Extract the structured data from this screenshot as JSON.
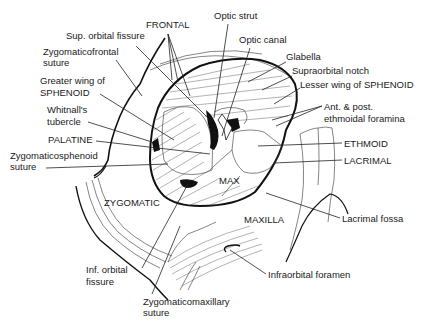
{
  "figure": {
    "labels": [
      {
        "id": "frontal",
        "text": "FRONTAL",
        "x": 146,
        "y": 28
      },
      {
        "id": "sup-orbital-fissure",
        "text": "Sup. orbital fissure",
        "x": 66,
        "y": 39
      },
      {
        "id": "zygomaticofrontal-suture-1",
        "text": "Zygomaticofrontal",
        "x": 43,
        "y": 55
      },
      {
        "id": "zygomaticofrontal-suture-2",
        "text": "suture",
        "x": 43,
        "y": 66
      },
      {
        "id": "greater-wing-1",
        "text": "Greater wing of",
        "x": 40,
        "y": 84
      },
      {
        "id": "greater-wing-2",
        "text": "SPHENOID",
        "x": 40,
        "y": 96
      },
      {
        "id": "whitnalls-1",
        "text": "Whitnall's",
        "x": 47,
        "y": 113
      },
      {
        "id": "whitnalls-2",
        "text": "tubercle",
        "x": 47,
        "y": 125
      },
      {
        "id": "palatine",
        "text": "PALATINE",
        "x": 48,
        "y": 143
      },
      {
        "id": "zygomaticosphenoid-1",
        "text": "Zygomaticosphenoid",
        "x": 10,
        "y": 159
      },
      {
        "id": "zygomaticosphenoid-2",
        "text": "suture",
        "x": 10,
        "y": 170
      },
      {
        "id": "zygomatic",
        "text": "ZYGOMATIC",
        "x": 104,
        "y": 206
      },
      {
        "id": "inf-orbital-fissure-1",
        "text": "Inf. orbital",
        "x": 86,
        "y": 273
      },
      {
        "id": "inf-orbital-fissure-2",
        "text": "fissure",
        "x": 86,
        "y": 285
      },
      {
        "id": "zygomaticomaxillary-1",
        "text": "Zygomaticomaxillary",
        "x": 143,
        "y": 305
      },
      {
        "id": "zygomaticomaxillary-2",
        "text": "suture",
        "x": 143,
        "y": 316
      },
      {
        "id": "optic-strut",
        "text": "Optic strut",
        "x": 214,
        "y": 19
      },
      {
        "id": "optic-canal",
        "text": "Optic canal",
        "x": 239,
        "y": 43
      },
      {
        "id": "glabella",
        "text": "Glabella",
        "x": 286,
        "y": 60
      },
      {
        "id": "supraorbital-notch",
        "text": "Supraorbital notch",
        "x": 292,
        "y": 74
      },
      {
        "id": "lesser-wing",
        "text": "Lesser wing of SPHENOID",
        "x": 300,
        "y": 88
      },
      {
        "id": "ethmoidal-foramina-1",
        "text": "Ant. & post.",
        "x": 324,
        "y": 110
      },
      {
        "id": "ethmoidal-foramina-2",
        "text": "ethmoidal foramina",
        "x": 324,
        "y": 122
      },
      {
        "id": "ethmoid",
        "text": "ETHMOID",
        "x": 344,
        "y": 147
      },
      {
        "id": "lacrimal",
        "text": "LACRIMAL",
        "x": 344,
        "y": 164
      },
      {
        "id": "max",
        "text": "MAX",
        "x": 219,
        "y": 184
      },
      {
        "id": "maxilla",
        "text": "MAXILLA",
        "x": 244,
        "y": 223
      },
      {
        "id": "lacrimal-fossa",
        "text": "Lacrimal fossa",
        "x": 342,
        "y": 222
      },
      {
        "id": "infraorbital-foramen",
        "text": "Infraorbital foramen",
        "x": 268,
        "y": 278
      }
    ]
  }
}
